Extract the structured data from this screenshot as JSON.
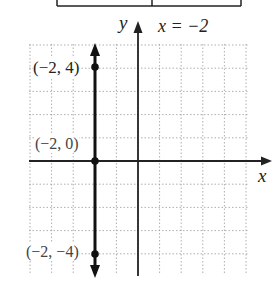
{
  "table_fragment": {
    "left": 57,
    "right": 241,
    "divider": 152,
    "bottom": 6
  },
  "graph": {
    "title_label": "x = −2",
    "x_axis_label": "x",
    "y_axis_label": "y",
    "grid": {
      "x_min_px": 29,
      "x_max_px": 248,
      "y_min_px": 44,
      "y_max_px": 275,
      "step_x": 21.6,
      "step_y": 23.2,
      "origin_x": 138,
      "origin_y": 161
    },
    "points": [
      {
        "label": "(−2, 4)",
        "x": -2,
        "y": 4
      },
      {
        "label": "(−2, 0)",
        "x": -2,
        "y": 0
      },
      {
        "label": "(−2, −4)",
        "x": -2,
        "y": -4
      }
    ],
    "line": {
      "equation": "x = -2",
      "x": -2
    }
  },
  "chart_data": {
    "type": "line",
    "title": "x = −2",
    "xlabel": "x",
    "ylabel": "y",
    "xlim": [
      -5,
      5
    ],
    "ylim": [
      -5,
      5
    ],
    "grid": true,
    "series": [
      {
        "name": "x = -2",
        "x": [
          -2,
          -2,
          -2
        ],
        "y": [
          4,
          0,
          -4
        ]
      }
    ],
    "annotations": [
      "(−2, 4)",
      "(−2, 0)",
      "(−2, −4)"
    ]
  }
}
